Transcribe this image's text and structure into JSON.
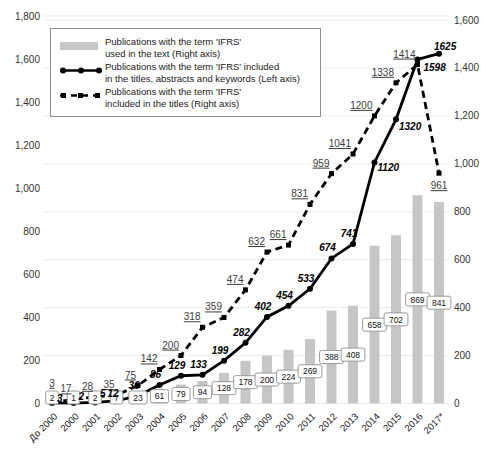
{
  "chart": {
    "legend": {
      "entries": [
        {
          "lines": [
            "Publications with the term 'IFRS'",
            "used in the text (Right axis)"
          ]
        },
        {
          "lines": [
            "Publications with the term 'IFRS' included",
            "in the titles, abstracts and keywords (Left axis)"
          ]
        },
        {
          "lines": [
            "Publications with the term 'IFRS'",
            "included in the titles (Right axis)"
          ]
        }
      ]
    }
  },
  "chart_data": {
    "type": "combo-bar-line",
    "categories": [
      "До 2000",
      "2000",
      "2001",
      "2002",
      "2003",
      "2004",
      "2005",
      "2006",
      "2007",
      "2008",
      "2009",
      "2010",
      "2011",
      "2012",
      "2013",
      "2014",
      "2015",
      "2016",
      "2017*"
    ],
    "series": [
      {
        "name": "Publications with the term 'IFRS' used in the text",
        "type": "bar",
        "axis": "right",
        "color": "#c6c6c6",
        "values": [
          2,
          1,
          2,
          7,
          23,
          61,
          79,
          94,
          128,
          178,
          200,
          224,
          269,
          388,
          408,
          658,
          702,
          869,
          841
        ]
      },
      {
        "name": "Publications with the term 'IFRS' included in the titles, abstracts and keywords",
        "type": "line",
        "style": "solid",
        "marker": "circle",
        "axis": "left",
        "color": "#000000",
        "values": [
          3,
          2,
          5,
          12,
          36,
          86,
          129,
          133,
          199,
          282,
          402,
          454,
          533,
          674,
          741,
          1120,
          1320,
          1598,
          1625
        ]
      },
      {
        "name": "Publications with the term 'IFRS' included in the titles",
        "type": "line",
        "style": "dashed",
        "marker": "square",
        "axis": "right",
        "color": "#000000",
        "values": [
          3,
          17,
          28,
          35,
          75,
          142,
          200,
          318,
          359,
          474,
          632,
          661,
          831,
          959,
          1041,
          1200,
          1338,
          1414,
          961
        ]
      }
    ],
    "left_axis": {
      "max": 1800,
      "tick_values": [
        0,
        200,
        400,
        600,
        800,
        1000,
        1200,
        1400,
        1600,
        1800
      ],
      "tick_labels": [
        "0",
        "200",
        "400",
        "600",
        "800",
        "1,000",
        "1,200",
        "1,400",
        "1,600",
        "1,800"
      ]
    },
    "right_axis": {
      "max": 1600,
      "tick_values": [
        0,
        200,
        400,
        600,
        800,
        1000,
        1200,
        1400,
        1600
      ],
      "tick_labels": [
        "0",
        "200",
        "400",
        "600",
        "800",
        "1,000",
        "1,200",
        "1,400",
        "1,600"
      ]
    },
    "grid": true,
    "legend_position": "top-left",
    "colors": {
      "bar_fill": "#c6c6c6",
      "line_color": "#000000",
      "grid_color": "#ebebe8",
      "axis_text": "#333333",
      "dashed_label_text": "#3d3d3d"
    }
  }
}
